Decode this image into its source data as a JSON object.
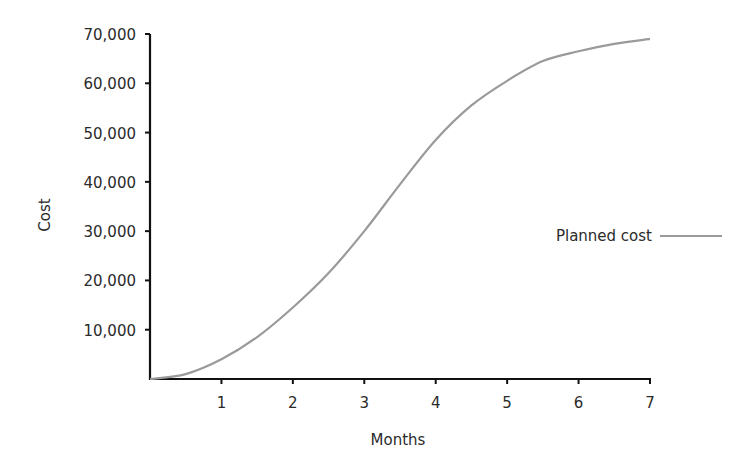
{
  "chart_data": {
    "type": "line",
    "title": "",
    "xlabel": "Months",
    "ylabel": "Cost",
    "xlim": [
      0,
      7
    ],
    "ylim": [
      0,
      70000
    ],
    "x_ticks": [
      1,
      2,
      3,
      4,
      5,
      6,
      7
    ],
    "x_tick_labels": [
      "1",
      "2",
      "3",
      "4",
      "5",
      "6",
      "7"
    ],
    "y_ticks": [
      10000,
      20000,
      30000,
      40000,
      50000,
      60000,
      70000
    ],
    "y_tick_labels": [
      "10,000",
      "20,000",
      "30,000",
      "40,000",
      "50,000",
      "60,000",
      "70,000"
    ],
    "grid": false,
    "legend_position": "right",
    "series": [
      {
        "name": "Planned cost",
        "color": "#9a9a9a",
        "x": [
          0,
          0.5,
          1,
          1.5,
          2,
          2.5,
          3,
          3.5,
          4,
          4.5,
          5,
          5.5,
          6,
          6.5,
          7
        ],
        "values": [
          0,
          1000,
          4000,
          8500,
          14500,
          21500,
          30000,
          39500,
          48500,
          55500,
          60500,
          64500,
          66500,
          68000,
          69000
        ]
      }
    ]
  }
}
